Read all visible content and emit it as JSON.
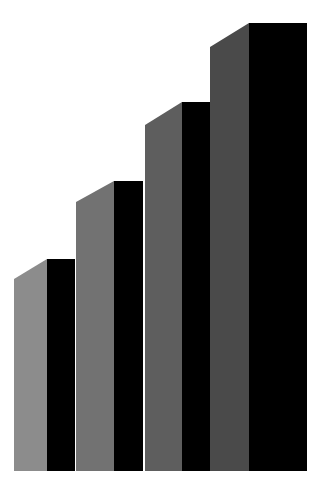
{
  "chart_data": {
    "type": "bar",
    "style": "3d-stepped",
    "title": "",
    "xlabel": "",
    "ylabel": "",
    "categories": [
      "1",
      "2",
      "3",
      "4"
    ],
    "values": [
      212,
      290,
      369,
      448
    ],
    "ylim": [
      0,
      455
    ],
    "grid": false,
    "legend": null,
    "baseline_y": 471,
    "bars": [
      {
        "side_x0": 14,
        "side_x1": 47,
        "front_x1": 75,
        "side_top": 279,
        "top": 259,
        "side_color": "#8c8c8c",
        "front_color": "#000000"
      },
      {
        "side_x0": 76,
        "side_x1": 114,
        "front_x1": 143,
        "side_top": 202,
        "top": 181,
        "side_color": "#727272",
        "front_color": "#000000"
      },
      {
        "side_x0": 145,
        "side_x1": 182,
        "front_x1": 210,
        "side_top": 125,
        "top": 102,
        "side_color": "#5e5e5e",
        "front_color": "#000000"
      },
      {
        "side_x0": 210,
        "side_x1": 249,
        "front_x1": 307,
        "side_top": 47,
        "top": 23,
        "side_color": "#4a4a4a",
        "front_color": "#000000"
      }
    ]
  },
  "colors": {
    "background": "#ffffff",
    "front": "#000000"
  }
}
